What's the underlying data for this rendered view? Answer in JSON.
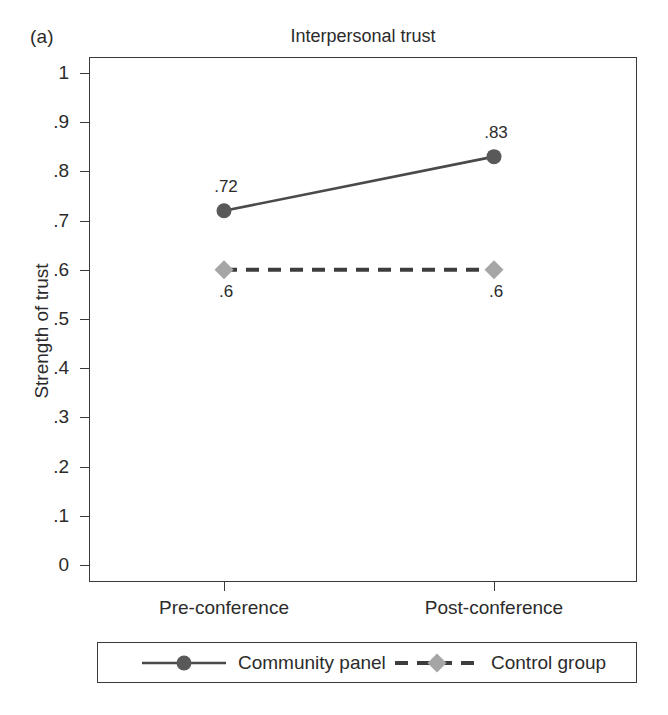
{
  "figure": {
    "panel_letter": "(a)",
    "title": "Interpersonal trust",
    "y_axis_title": "Strength of trust"
  },
  "chart_data": {
    "type": "line",
    "title": "Interpersonal trust",
    "xlabel": "",
    "ylabel": "Strength of trust",
    "categories": [
      "Pre-conference",
      "Post-conference"
    ],
    "ylim": [
      0,
      1
    ],
    "yticks": [
      "0",
      ".1",
      ".2",
      ".3",
      ".4",
      ".5",
      ".6",
      ".7",
      ".8",
      ".9",
      "1"
    ],
    "ytick_values": [
      0,
      0.1,
      0.2,
      0.3,
      0.4,
      0.5,
      0.6,
      0.7,
      0.8,
      0.9,
      1
    ],
    "grid": false,
    "legend_position": "bottom",
    "series": [
      {
        "name": "Community panel",
        "values": [
          0.72,
          0.83
        ],
        "point_labels": [
          ".72",
          ".83"
        ],
        "label_position": [
          "above",
          "above"
        ],
        "linestyle": "solid",
        "marker": "circle",
        "color": "#595959"
      },
      {
        "name": "Control group",
        "values": [
          0.6,
          0.6
        ],
        "point_labels": [
          ".6",
          ".6"
        ],
        "label_position": [
          "below",
          "below"
        ],
        "linestyle": "dashed",
        "marker": "diamond",
        "color": "#a6a6a6"
      }
    ]
  },
  "colors": {
    "axis": "#3a3a3a",
    "text": "#2b2b2b",
    "series_1": "#595959",
    "series_2": "#a6a6a6",
    "background": "#ffffff"
  }
}
